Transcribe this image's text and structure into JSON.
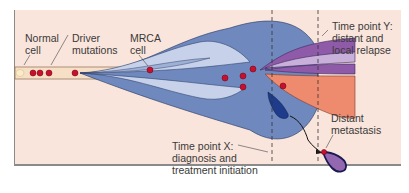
{
  "labels": {
    "normal_cell": "Normal\ncell",
    "driver_mutations": "Driver\nmutations",
    "mrca_cell": "MRCA\ncell",
    "time_point_y": "Time point Y:\ndistant and\nlocal relapse",
    "time_point_x": "Time point X:\ndiagnosis and\ntreatment initiation",
    "distant_metastasis": "Distant\nmetastasis"
  },
  "colors": {
    "background": "#f9e5dc",
    "normal_lineage": "#f7d9b9",
    "clone_light": "#c7d2ea",
    "clone_mid": "#9fb0d6",
    "clone_main": "#6f88bd",
    "clone_dark": "#1f3c8c",
    "subclone_purple": "#8f5aa8",
    "subclone_lilac": "#c9b0db",
    "subclone_salmon": "#ee8a6e",
    "mutation_dot": "#c8102e"
  }
}
